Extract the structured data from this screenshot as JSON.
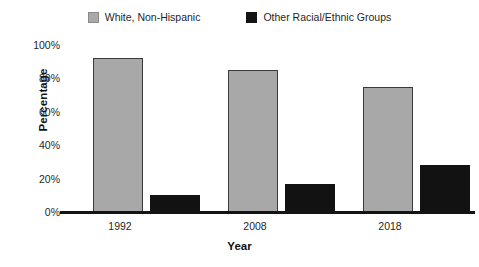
{
  "chart_data": {
    "type": "bar",
    "title": "",
    "xlabel": "Year",
    "ylabel": "Percentage",
    "categories": [
      "1992",
      "2008",
      "2018"
    ],
    "series": [
      {
        "name": "White, Non-Hispanic",
        "color": "#a8a8a8",
        "values": [
          92,
          85,
          75
        ]
      },
      {
        "name": "Other Racial/Ethnic Groups",
        "color": "#121212",
        "values": [
          10,
          17,
          28
        ]
      }
    ],
    "ylim": [
      0,
      100
    ],
    "yticks": [
      "0%",
      "20%",
      "40%",
      "60%",
      "80%",
      "100%"
    ],
    "ytick_values": [
      0,
      20,
      40,
      60,
      80,
      100
    ],
    "grid": false,
    "legend_position": "top-center"
  },
  "legend": {
    "items": [
      {
        "label": "White, Non-Hispanic",
        "swatch": "gray-swatch-icon"
      },
      {
        "label": "Other Racial/Ethnic Groups",
        "swatch": "black-swatch-icon"
      }
    ]
  },
  "axes": {
    "y_title": "Percentage",
    "x_title": "Year",
    "y_tick_labels": [
      "100%",
      "80%",
      "60%",
      "40%",
      "20%",
      "0%"
    ],
    "x_tick_labels": [
      "1992",
      "2008",
      "2018"
    ]
  }
}
